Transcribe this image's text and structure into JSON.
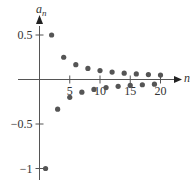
{
  "chart_data": {
    "type": "scatter",
    "title": "",
    "xlabel": "n",
    "ylabel": "a_n",
    "ylabel_display": {
      "base": "a",
      "sub": "n"
    },
    "formula": "a_n = (-1)^n / n",
    "x": [
      1,
      2,
      3,
      4,
      5,
      6,
      7,
      8,
      9,
      10,
      11,
      12,
      13,
      14,
      15,
      16,
      17,
      18,
      19,
      20
    ],
    "values": [
      -1,
      0.5,
      -0.3333,
      0.25,
      -0.2,
      0.1667,
      -0.1429,
      0.125,
      -0.1111,
      0.1,
      -0.0909,
      0.0833,
      -0.0769,
      0.0714,
      -0.0667,
      0.0625,
      -0.0588,
      0.0556,
      -0.0526,
      0.05
    ],
    "x_ticks": [
      5,
      10,
      15,
      20
    ],
    "x_tick_labels": [
      "5",
      "10",
      "15",
      "20"
    ],
    "y_ticks": [
      0.5,
      -0.5,
      -1
    ],
    "y_tick_labels": [
      "0.5",
      "−0.5",
      "−1"
    ],
    "xlim": [
      0,
      22
    ],
    "ylim": [
      -1.1,
      0.65
    ],
    "grid": false,
    "legend": null,
    "marker_color": "#555555",
    "axis_color": "#555555"
  }
}
